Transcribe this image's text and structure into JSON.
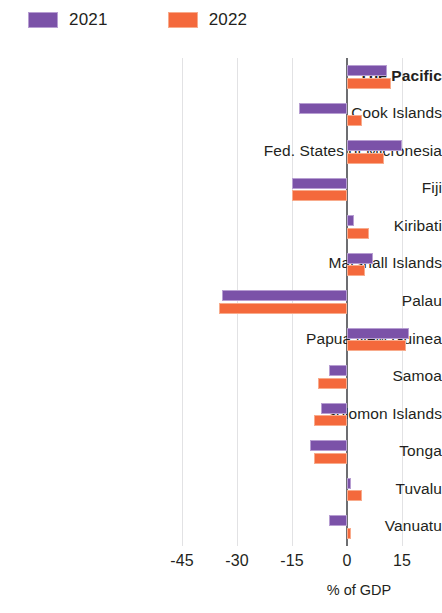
{
  "chart_data": {
    "type": "bar",
    "orientation": "horizontal",
    "title": "",
    "xlabel": "% of GDP",
    "ylabel": "",
    "xlim": [
      -52,
      33
    ],
    "xticks": [
      -45,
      -30,
      -15,
      0,
      15,
      30
    ],
    "xtick_labels": [
      "-45",
      "-30",
      "-15",
      "0",
      "15",
      "30"
    ],
    "grid": true,
    "legend_position": "top-left",
    "categories": [
      "The Pacific",
      "Cook Islands",
      "Fed. States of Micronesia",
      "Fiji",
      "Kiribati",
      "Marshall Islands",
      "Palau",
      "Papua New Guinea",
      "Samoa",
      "Solomon Islands",
      "Tonga",
      "Tuvalu",
      "Vanuatu"
    ],
    "emphasized_categories": [
      "The Pacific"
    ],
    "series": [
      {
        "name": "2021",
        "color": "#7b52a8",
        "edge_color": "#b79ed2",
        "values": [
          11,
          -13,
          15,
          -15,
          2,
          7,
          -34,
          17,
          -5,
          -7,
          -10,
          1,
          -5
        ]
      },
      {
        "name": "2022",
        "color": "#f4693c",
        "edge_color": "#f8ab8c",
        "values": [
          12,
          4,
          10,
          -15,
          6,
          5,
          -35,
          16,
          -8,
          -9,
          -9,
          4,
          1
        ]
      }
    ]
  },
  "legend": {
    "items": [
      {
        "label": "2021",
        "color": "#7b52a8"
      },
      {
        "label": "2022",
        "color": "#f4693c"
      }
    ]
  },
  "axis": {
    "title": "% of GDP"
  }
}
